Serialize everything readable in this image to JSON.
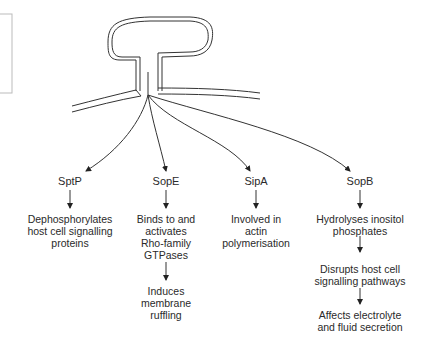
{
  "diagram": {
    "structure": "T-shaped secretion apparatus spanning host cell membrane",
    "effectors": [
      {
        "name": "SptP",
        "effects": [
          [
            "Dephosphorylates",
            "host cell signalling",
            "proteins"
          ]
        ]
      },
      {
        "name": "SopE",
        "effects": [
          [
            "Binds to and",
            "activates",
            "Rho-family",
            "GTPases"
          ],
          [
            "Induces",
            "membrane",
            "ruffling"
          ]
        ]
      },
      {
        "name": "SipA",
        "effects": [
          [
            "Involved in",
            "actin",
            "polymerisation"
          ]
        ]
      },
      {
        "name": "SopB",
        "effects": [
          [
            "Hydrolyses inositol",
            "phosphates"
          ],
          [
            "Disrupts host cell",
            "signalling pathways"
          ],
          [
            "Affects electrolyte",
            "and fluid secretion"
          ]
        ]
      }
    ],
    "colors": {
      "line": "#333333",
      "box": "#bbbbbb",
      "text": "#2a2a2a"
    }
  }
}
